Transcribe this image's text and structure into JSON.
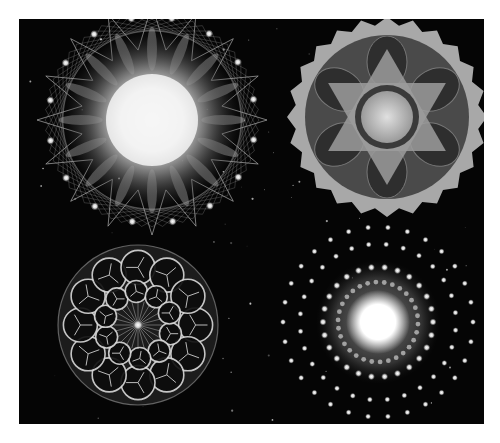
{
  "image": {
    "description": "Grayscale composite of four mandala / kaleidoscopic fractal patterns on a black background",
    "colors": {
      "background": "#050505",
      "margin": "#ffffff",
      "glow": "#ffffff",
      "mid": "#9a9a9a",
      "dark": "#3a3a3a"
    },
    "panels": [
      {
        "position": "top-left",
        "motif": "star-spiked-mandala",
        "center": [
          152,
          120
        ],
        "radius": 115,
        "spikes": 16
      },
      {
        "position": "top-right",
        "motif": "scalloped-hexagram-kaleidoscope",
        "center": [
          387,
          117
        ],
        "radius": 100,
        "scallops": 24
      },
      {
        "position": "bottom-left",
        "motif": "rosette-circle-mandala",
        "center": [
          138,
          325
        ],
        "radius": 80,
        "rosettes": 12
      },
      {
        "position": "bottom-right",
        "motif": "dotted-rings-glow",
        "center": [
          378,
          322
        ],
        "core_radius": 24,
        "rings": [
          55,
          78,
          95
        ]
      }
    ]
  }
}
